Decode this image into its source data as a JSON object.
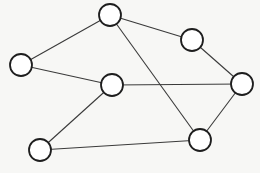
{
  "diagram": {
    "type": "undirected-graph",
    "background": "#f7f7f5",
    "node_radius": 11,
    "nodes": [
      {
        "id": "A",
        "x": 110,
        "y": 15
      },
      {
        "id": "B",
        "x": 21,
        "y": 65
      },
      {
        "id": "C",
        "x": 112,
        "y": 85
      },
      {
        "id": "D",
        "x": 192,
        "y": 40
      },
      {
        "id": "E",
        "x": 242,
        "y": 84
      },
      {
        "id": "F",
        "x": 200,
        "y": 140
      },
      {
        "id": "G",
        "x": 40,
        "y": 150
      }
    ],
    "edges": [
      [
        "A",
        "B"
      ],
      [
        "A",
        "D"
      ],
      [
        "A",
        "F"
      ],
      [
        "B",
        "C"
      ],
      [
        "C",
        "E"
      ],
      [
        "C",
        "G"
      ],
      [
        "D",
        "E"
      ],
      [
        "E",
        "F"
      ],
      [
        "G",
        "F"
      ]
    ]
  }
}
